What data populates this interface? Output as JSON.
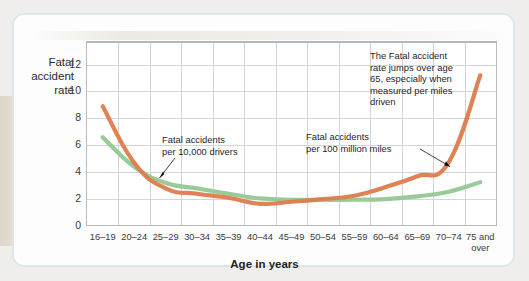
{
  "figure": {
    "background_color": "#efeeec",
    "card_color": "#ffffff"
  },
  "chart_data": {
    "type": "line",
    "title": "",
    "xlabel": "Age in years",
    "ylabel": "Fatal accident rate",
    "ylim": [
      0,
      13.6
    ],
    "yticks": [
      0,
      2,
      4,
      6,
      8,
      10,
      12
    ],
    "ytick_labels": [
      "0",
      "2",
      "4",
      "6",
      "8",
      "10",
      "12"
    ],
    "grid": true,
    "legend": "annotations",
    "categories": [
      "16–19",
      "20–24",
      "25–29",
      "30–34",
      "35–39",
      "40–44",
      "45–49",
      "50–54",
      "55–59",
      "60–64",
      "65–69",
      "70–74",
      "75 and over"
    ],
    "category_lines": [
      [
        "16–19"
      ],
      [
        "20–24"
      ],
      [
        "25–29"
      ],
      [
        "30–34"
      ],
      [
        "35–39"
      ],
      [
        "40–44"
      ],
      [
        "45–49"
      ],
      [
        "50–54"
      ],
      [
        "55–59"
      ],
      [
        "60–64"
      ],
      [
        "65–69"
      ],
      [
        "70–74"
      ],
      [
        "75 and",
        "over"
      ]
    ],
    "series": [
      {
        "name": "Fatal accidents per 100 million miles",
        "color": "#de7b4b",
        "values": [
          8.9,
          4.7,
          2.8,
          2.4,
          2.1,
          1.65,
          1.8,
          2.0,
          2.25,
          2.9,
          3.7,
          4.75,
          11.2
        ]
      },
      {
        "name": "Fatal accidents per 10,000 drivers",
        "color": "#93c794",
        "values": [
          6.6,
          4.4,
          3.2,
          2.8,
          2.4,
          2.05,
          1.95,
          1.95,
          1.95,
          2.0,
          2.2,
          2.55,
          3.25
        ]
      }
    ],
    "annotations": [
      {
        "id": "green-series-callout",
        "text": "Fatal accidents per 10,000 drivers",
        "lines": [
          "Fatal accidents",
          "per 10,000 drivers"
        ],
        "points_to": "Fatal accidents per 10,000 drivers"
      },
      {
        "id": "orange-series-callout",
        "text": "Fatal accidents per 100 million miles",
        "lines": [
          "Fatal accidents",
          "per 100 million miles"
        ],
        "points_to": "Fatal accidents per 100 million miles"
      },
      {
        "id": "elderly-jump-callout",
        "text": "The Fatal accident rate jumps over age 65, especially when measured per miles driven",
        "lines": [
          "The Fatal accident",
          "rate jumps over age",
          "65, especially when",
          "measured per miles",
          "driven"
        ],
        "points_to": null
      }
    ]
  }
}
